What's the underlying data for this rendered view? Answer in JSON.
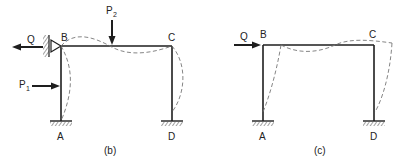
{
  "figure": {
    "panels": [
      {
        "id": "b",
        "caption": "(b)",
        "nodes": {
          "A": "A",
          "B": "B",
          "C": "C",
          "D": "D"
        },
        "supports": {
          "A": "fixed",
          "D": "fixed",
          "B": "pinned-roller against wall"
        },
        "loads": [
          {
            "name": "Q",
            "label": "Q",
            "direction": "left",
            "at": "B"
          },
          {
            "name": "P1",
            "label": "P",
            "subscript": "1",
            "direction": "right",
            "at": "column AB"
          },
          {
            "name": "P2",
            "label": "P",
            "subscript": "2",
            "direction": "down",
            "at": "beam BC"
          }
        ],
        "deflected_shape": "dashed"
      },
      {
        "id": "c",
        "caption": "(c)",
        "nodes": {
          "A": "A",
          "B": "B",
          "C": "C",
          "D": "D"
        },
        "supports": {
          "A": "fixed",
          "D": "fixed"
        },
        "loads": [
          {
            "name": "Q",
            "label": "Q",
            "direction": "right",
            "at": "B"
          }
        ],
        "deflected_shape": "dashed (sway)"
      }
    ]
  }
}
